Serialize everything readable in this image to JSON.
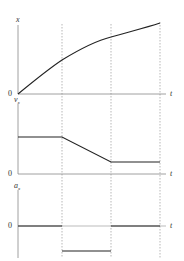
{
  "diagram": {
    "type": "motion graphs",
    "colors": {
      "curve": "#222222",
      "axis": "#888888",
      "dashed": "#999999"
    },
    "time_markers": 3,
    "panels": [
      {
        "id": "position",
        "y_label": "x",
        "x_label": "t",
        "origin_label": "0",
        "description": "concave-down curve rising from origin"
      },
      {
        "id": "velocity",
        "y_label": "v",
        "y_label_sub": "x",
        "x_label": "t",
        "origin_label": "0",
        "description": "constant, then linear decrease, then constant lower value"
      },
      {
        "id": "acceleration",
        "y_label": "a",
        "y_label_sub": "x",
        "x_label": "t",
        "origin_label": "0",
        "description": "zero, then constant negative, then zero"
      }
    ]
  }
}
